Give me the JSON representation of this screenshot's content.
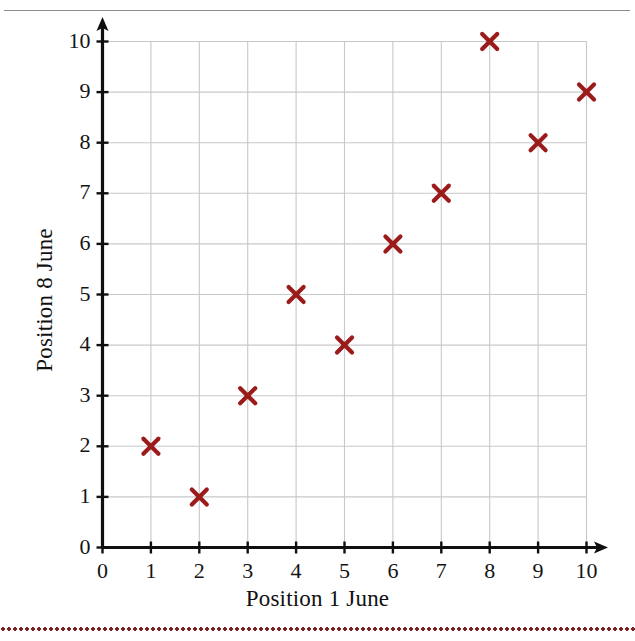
{
  "figure": {
    "top_rule_color": "#8d8d8d",
    "bottom_rule_color": "#7d2222",
    "background_color": "#ffffff"
  },
  "chart_data": {
    "type": "scatter",
    "title": "",
    "xlabel": "Position 1 June",
    "ylabel": "Position 8 June",
    "xlim": [
      0,
      10
    ],
    "ylim": [
      0,
      10
    ],
    "grid": true,
    "grid_color": "#c8c8c8",
    "axis_color": "#101010",
    "marker": "x",
    "marker_color": "#9b1b1b",
    "legend": null,
    "x_ticks": [
      "0",
      "1",
      "2",
      "3",
      "4",
      "5",
      "6",
      "7",
      "8",
      "9",
      "10"
    ],
    "y_ticks": [
      "0",
      "1",
      "2",
      "3",
      "4",
      "5",
      "6",
      "7",
      "8",
      "9",
      "10"
    ],
    "x": [
      1,
      2,
      3,
      4,
      5,
      6,
      7,
      8,
      9,
      10
    ],
    "y": [
      2,
      1,
      3,
      5,
      4,
      6,
      7,
      10,
      8,
      9
    ],
    "points": [
      {
        "x": 1,
        "y": 2
      },
      {
        "x": 2,
        "y": 1
      },
      {
        "x": 3,
        "y": 3
      },
      {
        "x": 4,
        "y": 5
      },
      {
        "x": 5,
        "y": 4
      },
      {
        "x": 6,
        "y": 6
      },
      {
        "x": 7,
        "y": 7
      },
      {
        "x": 8,
        "y": 10
      },
      {
        "x": 9,
        "y": 8
      },
      {
        "x": 10,
        "y": 9
      }
    ]
  }
}
